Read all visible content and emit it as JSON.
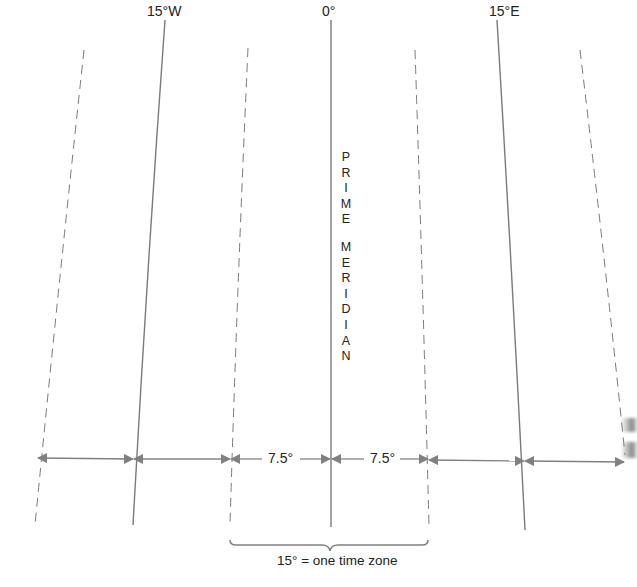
{
  "diagram": {
    "meridian_labels": {
      "w15": "15°W",
      "zero": "0°",
      "e15": "15°E"
    },
    "prime_meridian_word1": [
      "P",
      "R",
      "I",
      "M",
      "E"
    ],
    "prime_meridian_word2": [
      "M",
      "E",
      "R",
      "I",
      "D",
      "I",
      "A",
      "N"
    ],
    "half_zone_left": "7.5°",
    "half_zone_right": "7.5°",
    "brace_caption": "15° = one time zone",
    "colors": {
      "line": "#7a7a7a",
      "text": "#222222",
      "arrow": "#808080"
    },
    "meridians": [
      {
        "name": "zone-boundary-far-west",
        "style": "dashed",
        "top": [
          84,
          50
        ],
        "bottom": [
          35,
          525
        ]
      },
      {
        "name": "meridian-15w",
        "style": "solid",
        "top": [
          165,
          20
        ],
        "bottom": [
          133,
          525
        ]
      },
      {
        "name": "zone-boundary-7.5w",
        "style": "dashed",
        "top": [
          248,
          48
        ],
        "bottom": [
          230,
          525
        ]
      },
      {
        "name": "prime-meridian-0",
        "style": "solid",
        "top": [
          331,
          20
        ],
        "bottom": [
          331,
          527
        ]
      },
      {
        "name": "zone-boundary-7.5e",
        "style": "dashed",
        "top": [
          415,
          50
        ],
        "bottom": [
          429,
          527
        ]
      },
      {
        "name": "meridian-15e",
        "style": "solid",
        "top": [
          497,
          20
        ],
        "bottom": [
          525,
          530
        ]
      },
      {
        "name": "zone-boundary-far-east",
        "style": "dashed",
        "top": [
          580,
          50
        ],
        "bottom": [
          625,
          455
        ]
      }
    ]
  }
}
